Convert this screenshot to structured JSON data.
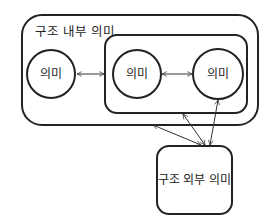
{
  "diagram": {
    "outer_box": {
      "label": "구조 내부 의미"
    },
    "inner_box": {},
    "nodes": [
      {
        "id": "left",
        "label": "의미"
      },
      {
        "id": "middle",
        "label": "의미"
      },
      {
        "id": "right",
        "label": "의미"
      }
    ],
    "external_box": {
      "label": "구조 외부 의미"
    },
    "edges": [
      {
        "from": "left",
        "to": "inner_box",
        "type": "bidirectional"
      },
      {
        "from": "middle",
        "to": "right",
        "type": "bidirectional"
      },
      {
        "from": "outer_box",
        "to": "external_box",
        "type": "bidirectional"
      },
      {
        "from": "inner_box",
        "to": "external_box",
        "type": "bidirectional"
      },
      {
        "from": "right",
        "to": "external_box",
        "type": "bidirectional"
      }
    ],
    "colors": {
      "stroke": "#222222",
      "background": "#ffffff"
    }
  }
}
